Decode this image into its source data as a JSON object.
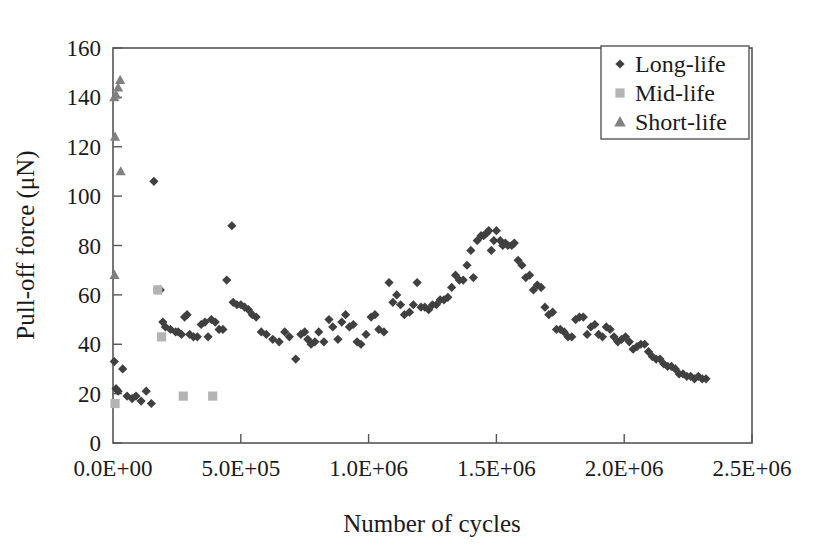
{
  "chart_data": {
    "type": "scatter",
    "title": "",
    "xlabel": "Number of cycles",
    "ylabel": "Pull-off force (μN)",
    "xlim": [
      0,
      2500000
    ],
    "ylim": [
      0,
      160
    ],
    "xticks": [
      0,
      500000,
      1000000,
      1500000,
      2000000,
      2500000
    ],
    "xtick_labels": [
      "0.0E+00",
      "5.0E+05",
      "1.0E+06",
      "1.5E+06",
      "2.0E+06",
      "2.5E+06"
    ],
    "yticks": [
      0,
      20,
      40,
      60,
      80,
      100,
      120,
      140,
      160
    ],
    "ytick_labels": [
      "0",
      "20",
      "40",
      "60",
      "80",
      "100",
      "120",
      "140",
      "160"
    ],
    "grid": false,
    "legend_position": "top-right",
    "series": [
      {
        "name": "Long-life",
        "marker": "diamond",
        "color": "#404040",
        "points": [
          [
            5000,
            33
          ],
          [
            12000,
            22
          ],
          [
            20000,
            21
          ],
          [
            38000,
            30
          ],
          [
            55000,
            19
          ],
          [
            75000,
            18
          ],
          [
            90000,
            19
          ],
          [
            110000,
            17
          ],
          [
            130000,
            21
          ],
          [
            150000,
            16
          ],
          [
            160000,
            106
          ],
          [
            175000,
            62
          ],
          [
            185000,
            62
          ],
          [
            195000,
            49
          ],
          [
            205000,
            47
          ],
          [
            225000,
            46
          ],
          [
            245000,
            45
          ],
          [
            255000,
            45
          ],
          [
            268000,
            44
          ],
          [
            280000,
            51
          ],
          [
            290000,
            52
          ],
          [
            300000,
            44
          ],
          [
            315000,
            43
          ],
          [
            330000,
            43
          ],
          [
            345000,
            48
          ],
          [
            360000,
            49
          ],
          [
            372000,
            43
          ],
          [
            385000,
            50
          ],
          [
            400000,
            49
          ],
          [
            415000,
            46
          ],
          [
            430000,
            46
          ],
          [
            445000,
            66
          ],
          [
            465000,
            88
          ],
          [
            470000,
            57
          ],
          [
            485000,
            56
          ],
          [
            500000,
            56
          ],
          [
            515000,
            55
          ],
          [
            530000,
            54
          ],
          [
            545000,
            52
          ],
          [
            560000,
            51
          ],
          [
            580000,
            45
          ],
          [
            600000,
            44
          ],
          [
            625000,
            42
          ],
          [
            650000,
            41
          ],
          [
            672000,
            45
          ],
          [
            690000,
            43
          ],
          [
            715000,
            34
          ],
          [
            735000,
            44
          ],
          [
            750000,
            45
          ],
          [
            762000,
            42
          ],
          [
            775000,
            40
          ],
          [
            790000,
            41
          ],
          [
            805000,
            45
          ],
          [
            825000,
            41
          ],
          [
            845000,
            50
          ],
          [
            860000,
            47
          ],
          [
            880000,
            42
          ],
          [
            895000,
            49
          ],
          [
            910000,
            52
          ],
          [
            925000,
            47
          ],
          [
            940000,
            48
          ],
          [
            955000,
            41
          ],
          [
            970000,
            40
          ],
          [
            990000,
            44
          ],
          [
            1010000,
            51
          ],
          [
            1025000,
            52
          ],
          [
            1040000,
            46
          ],
          [
            1060000,
            45
          ],
          [
            1080000,
            65
          ],
          [
            1095000,
            57
          ],
          [
            1110000,
            60
          ],
          [
            1125000,
            56
          ],
          [
            1140000,
            52
          ],
          [
            1160000,
            53
          ],
          [
            1175000,
            56
          ],
          [
            1190000,
            65
          ],
          [
            1205000,
            55
          ],
          [
            1220000,
            55
          ],
          [
            1235000,
            54
          ],
          [
            1250000,
            56
          ],
          [
            1265000,
            56
          ],
          [
            1280000,
            58
          ],
          [
            1295000,
            58
          ],
          [
            1310000,
            59
          ],
          [
            1325000,
            63
          ],
          [
            1340000,
            68
          ],
          [
            1355000,
            66
          ],
          [
            1370000,
            66
          ],
          [
            1385000,
            72
          ],
          [
            1400000,
            78
          ],
          [
            1410000,
            67
          ],
          [
            1425000,
            82
          ],
          [
            1440000,
            84
          ],
          [
            1450000,
            84
          ],
          [
            1462000,
            85
          ],
          [
            1470000,
            86
          ],
          [
            1480000,
            78
          ],
          [
            1490000,
            82
          ],
          [
            1500000,
            86
          ],
          [
            1515000,
            82
          ],
          [
            1525000,
            80
          ],
          [
            1535000,
            81
          ],
          [
            1545000,
            80
          ],
          [
            1560000,
            80
          ],
          [
            1570000,
            81
          ],
          [
            1585000,
            74
          ],
          [
            1600000,
            72
          ],
          [
            1615000,
            67
          ],
          [
            1630000,
            68
          ],
          [
            1645000,
            62
          ],
          [
            1660000,
            64
          ],
          [
            1675000,
            63
          ],
          [
            1690000,
            55
          ],
          [
            1705000,
            52
          ],
          [
            1720000,
            53
          ],
          [
            1735000,
            46
          ],
          [
            1750000,
            46
          ],
          [
            1765000,
            45
          ],
          [
            1780000,
            43
          ],
          [
            1795000,
            43
          ],
          [
            1810000,
            50
          ],
          [
            1825000,
            51
          ],
          [
            1840000,
            51
          ],
          [
            1855000,
            44
          ],
          [
            1870000,
            47
          ],
          [
            1885000,
            48
          ],
          [
            1900000,
            44
          ],
          [
            1915000,
            43
          ],
          [
            1930000,
            47
          ],
          [
            1945000,
            46
          ],
          [
            1960000,
            43
          ],
          [
            1975000,
            41
          ],
          [
            1990000,
            42
          ],
          [
            2005000,
            43
          ],
          [
            2020000,
            41
          ],
          [
            2035000,
            38
          ],
          [
            2050000,
            39
          ],
          [
            2065000,
            40
          ],
          [
            2080000,
            40
          ],
          [
            2095000,
            37
          ],
          [
            2110000,
            35
          ],
          [
            2125000,
            34
          ],
          [
            2140000,
            34
          ],
          [
            2155000,
            32
          ],
          [
            2170000,
            31
          ],
          [
            2185000,
            31
          ],
          [
            2200000,
            30
          ],
          [
            2215000,
            28
          ],
          [
            2230000,
            28
          ],
          [
            2245000,
            27
          ],
          [
            2260000,
            27
          ],
          [
            2275000,
            26
          ],
          [
            2290000,
            27
          ],
          [
            2305000,
            26
          ],
          [
            2320000,
            26
          ]
        ]
      },
      {
        "name": "Mid-life",
        "marker": "square",
        "color": "#b4b4b4",
        "points": [
          [
            8000,
            16
          ],
          [
            175000,
            62
          ],
          [
            190000,
            43
          ],
          [
            275000,
            19
          ],
          [
            390000,
            19
          ]
        ]
      },
      {
        "name": "Short-life",
        "marker": "triangle",
        "color": "#808080",
        "points": [
          [
            5000,
            140
          ],
          [
            12000,
            141
          ],
          [
            20000,
            144
          ],
          [
            28000,
            147
          ],
          [
            8000,
            124
          ],
          [
            30000,
            110
          ],
          [
            6000,
            68
          ]
        ]
      }
    ]
  },
  "legend": {
    "items": [
      {
        "label": "Long-life",
        "marker": "diamond-marker-icon"
      },
      {
        "label": "Mid-life",
        "marker": "square-marker-icon"
      },
      {
        "label": "Short-life",
        "marker": "triangle-marker-icon"
      }
    ]
  },
  "colors": {
    "long_life": "#404040",
    "mid_life": "#b4b4b4",
    "short_life": "#808080",
    "axis": "#555555",
    "text": "#1a1a1a",
    "background": "#ffffff"
  }
}
